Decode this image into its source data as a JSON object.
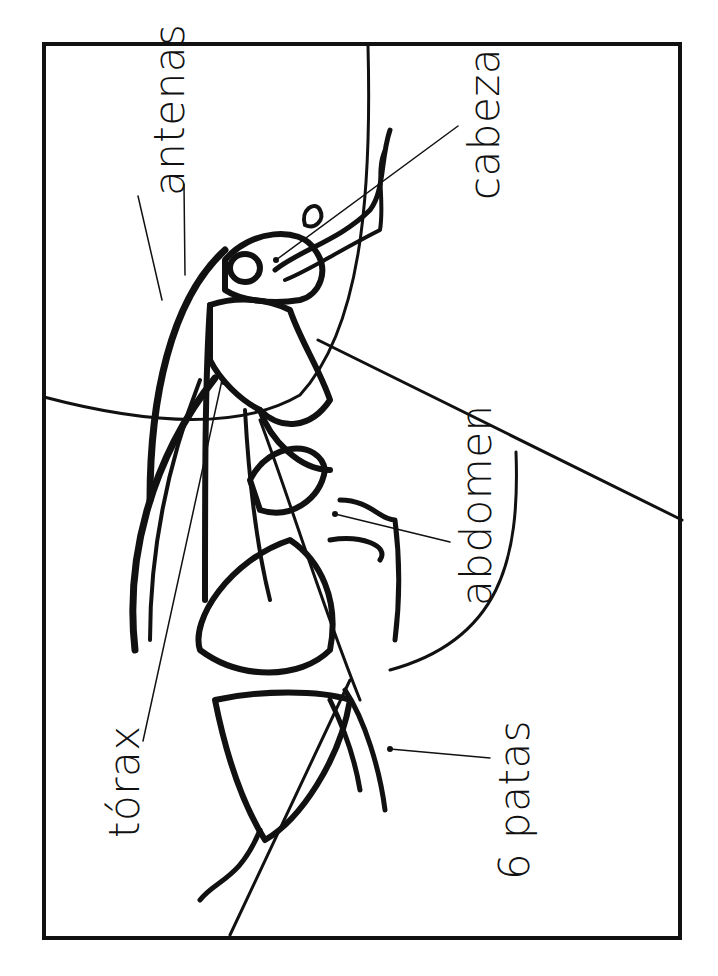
{
  "diagram": {
    "title": "",
    "orientation": "rotated 90° counter-clockwise",
    "labels": [
      {
        "id": "antenas",
        "text": "antenas"
      },
      {
        "id": "cabeza",
        "text": "cabeza"
      },
      {
        "id": "abdomen",
        "text": "abdomen"
      },
      {
        "id": "torax",
        "text": "tórax"
      },
      {
        "id": "patas",
        "text": "6 patas"
      }
    ],
    "colors": {
      "line": "#111111",
      "background": "#ffffff"
    }
  }
}
